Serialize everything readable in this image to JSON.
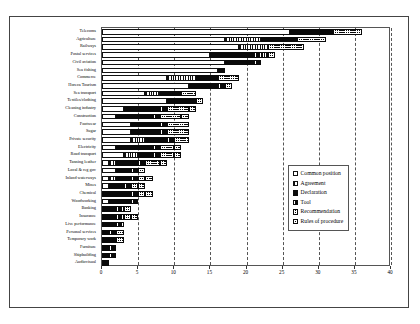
{
  "chart_data": {
    "type": "bar",
    "orientation": "horizontal",
    "stacked": true,
    "title": "",
    "xlabel": "",
    "ylabel": "",
    "xlim": [
      0,
      40
    ],
    "xticks": [
      0,
      5,
      10,
      15,
      20,
      25,
      30,
      35,
      40
    ],
    "grid": "vertical-dashed",
    "legend_position": "center-right-inside",
    "categories": [
      "Telecoms",
      "Agriculture",
      "Railways",
      "Postal services",
      "Civil aviation",
      "Sea fishing",
      "Commerce",
      "Horeca Tourism",
      "Sea transport",
      "Textiles/clothing",
      "Cleaning industry",
      "Construction",
      "Footwear",
      "Sugar",
      "Private security",
      "Electricity",
      "Road transport",
      "Tanning leather",
      "Local & reg gov",
      "Inland waterways",
      "Mines",
      "Chemical",
      "Woodworking",
      "Banking",
      "Insurance",
      "Live performance",
      "Personal services",
      "Temporary work",
      "Furniture",
      "Shipbuilding",
      "Audiovisual"
    ],
    "series": [
      {
        "name": "Common position",
        "key": "s-common",
        "values": [
          26,
          17,
          19,
          15,
          17,
          16,
          9,
          12,
          6,
          9,
          3,
          2,
          4,
          4,
          4,
          2,
          3,
          1,
          2,
          1,
          1,
          0,
          1,
          0,
          0,
          0,
          0,
          0,
          0,
          0,
          0
        ]
      },
      {
        "name": "Agreement",
        "key": "s-agreement",
        "values": [
          0,
          5,
          4,
          0,
          0,
          0,
          4,
          0,
          2,
          0,
          0,
          0,
          0,
          0,
          2,
          0,
          2,
          1,
          0,
          1,
          0,
          0,
          0,
          0,
          0,
          0,
          0,
          0,
          0,
          0,
          0
        ]
      },
      {
        "name": "Declaration",
        "key": "s-declaration",
        "values": [
          6,
          5,
          0,
          6,
          4,
          1,
          3,
          4,
          3,
          4,
          5,
          5,
          4,
          4,
          3,
          5,
          2,
          3,
          2,
          2,
          2,
          4,
          3,
          2,
          2,
          2,
          1,
          2,
          1,
          1,
          1
        ]
      },
      {
        "name": "Tool",
        "key": "s-tool",
        "values": [
          0,
          0,
          0,
          2,
          1,
          0,
          0,
          1,
          0,
          0,
          1,
          1,
          1,
          1,
          1,
          1,
          1,
          1,
          1,
          1,
          1,
          1,
          1,
          1,
          1,
          1,
          1,
          0,
          1,
          1,
          0
        ]
      },
      {
        "name": "Recommendation",
        "key": "s-recommendation",
        "values": [
          4,
          4,
          5,
          1,
          0,
          0,
          3,
          1,
          2,
          1,
          3,
          3,
          3,
          3,
          2,
          2,
          2,
          2,
          1,
          1,
          1,
          1,
          0,
          1,
          1,
          0,
          1,
          1,
          0,
          0,
          0
        ]
      },
      {
        "name": "Rules of procedure",
        "key": "s-rules",
        "values": [
          0,
          0,
          0,
          0,
          0,
          0,
          0,
          0,
          0,
          0,
          1,
          1,
          0,
          0,
          0,
          1,
          1,
          1,
          0,
          1,
          1,
          1,
          0,
          0,
          1,
          0,
          0,
          0,
          0,
          0,
          0
        ]
      }
    ],
    "totals": [
      36,
      31,
      28,
      24,
      22,
      17,
      19,
      18,
      13,
      14,
      13,
      12,
      12,
      12,
      12,
      11,
      11,
      9,
      6,
      7,
      6,
      7,
      5,
      4,
      5,
      3,
      3,
      3,
      2,
      2,
      1
    ]
  },
  "legend": {
    "items": [
      {
        "label": "Common position"
      },
      {
        "label": "Agreement"
      },
      {
        "label": "Declaration"
      },
      {
        "label": "Tool"
      },
      {
        "label": "Recommendation"
      },
      {
        "label": "Rules of procedure"
      }
    ]
  }
}
